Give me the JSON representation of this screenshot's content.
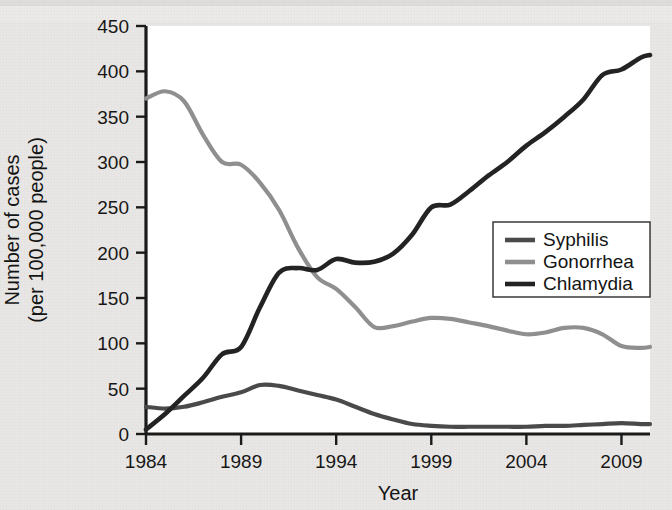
{
  "chart_data": {
    "type": "line",
    "title": "",
    "xlabel": "Year",
    "ylabel": "Number of cases\n(per 100,000 people)",
    "ylabel_line1": "Number of cases",
    "ylabel_line2": "(per 100,000 people)",
    "xlim": [
      1984,
      2010.5
    ],
    "ylim": [
      0,
      450
    ],
    "xticks": [
      1984,
      1989,
      1994,
      1999,
      2004,
      2009
    ],
    "xticklabels": [
      "1984",
      "1989",
      "1994",
      "1999",
      "2004",
      "2009"
    ],
    "yticks": [
      0,
      50,
      100,
      150,
      200,
      250,
      300,
      350,
      400,
      450
    ],
    "yticklabels": [
      "0",
      "50",
      "100",
      "150",
      "200",
      "250",
      "300",
      "350",
      "400",
      "450"
    ],
    "grid": false,
    "legend_position": "center-right",
    "series": [
      {
        "name": "Syphilis",
        "color": "#4a4a4a",
        "width": 4.2,
        "x": [
          1984,
          1985,
          1986,
          1987,
          1988,
          1989,
          1990,
          1991,
          1992,
          1993,
          1994,
          1995,
          1996,
          1997,
          1998,
          1999,
          2000,
          2001,
          2002,
          2003,
          2004,
          2005,
          2006,
          2007,
          2008,
          2009,
          2010,
          2010.5
        ],
        "values": [
          30,
          28,
          30,
          35,
          41,
          46,
          54,
          53,
          48,
          43,
          38,
          30,
          22,
          16,
          11,
          9,
          8,
          8,
          8,
          8,
          8,
          9,
          9,
          10,
          11,
          12,
          11,
          11
        ]
      },
      {
        "name": "Gonorrhea",
        "color": "#8f8f8f",
        "width": 4.2,
        "x": [
          1984,
          1985,
          1986,
          1987,
          1988,
          1989,
          1990,
          1991,
          1992,
          1993,
          1994,
          1995,
          1996,
          1997,
          1998,
          1999,
          2000,
          2001,
          2002,
          2003,
          2004,
          2005,
          2006,
          2007,
          2008,
          2009,
          2010,
          2010.5
        ],
        "values": [
          370,
          378,
          367,
          330,
          300,
          297,
          277,
          247,
          205,
          173,
          160,
          140,
          118,
          119,
          124,
          128,
          127,
          123,
          119,
          114,
          110,
          112,
          117,
          117,
          110,
          97,
          95,
          96
        ]
      },
      {
        "name": "Chlamydia",
        "color": "#232323",
        "width": 4.6,
        "x": [
          1984,
          1985,
          1986,
          1987,
          1988,
          1989,
          1990,
          1991,
          1992,
          1993,
          1994,
          1995,
          1996,
          1997,
          1998,
          1999,
          2000,
          2001,
          2002,
          2003,
          2004,
          2005,
          2006,
          2007,
          2008,
          2009,
          2010,
          2010.5
        ],
        "values": [
          5,
          22,
          42,
          62,
          88,
          96,
          140,
          178,
          183,
          181,
          193,
          189,
          190,
          199,
          220,
          250,
          253,
          268,
          285,
          300,
          318,
          333,
          350,
          369,
          396,
          402,
          415,
          418
        ]
      }
    ]
  },
  "legend": {
    "items": [
      {
        "label": "Syphilis",
        "color": "#4a4a4a"
      },
      {
        "label": "Gonorrhea",
        "color": "#8f8f8f"
      },
      {
        "label": "Chlamydia",
        "color": "#232323"
      }
    ]
  }
}
